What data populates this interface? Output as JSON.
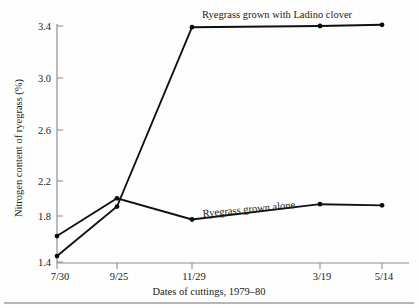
{
  "chart_data": {
    "type": "line",
    "title": "",
    "xlabel": "Dates of cuttings, 1979–80",
    "ylabel": "Nitrogen content of ryegrass (%)",
    "categories": [
      "7/30",
      "9/25",
      "11/29",
      "3/19",
      "5/14"
    ],
    "x_tick_labels": [
      "7/30",
      "9/25",
      "11/29",
      "3/19",
      "5/14"
    ],
    "y_tick_labels": [
      "1.4",
      "1.8",
      "2.2",
      "2.6",
      "3.0",
      "3.4"
    ],
    "y_tick_values": [
      1.4,
      1.8,
      2.2,
      2.6,
      3.0,
      3.4
    ],
    "ylim": [
      1.4,
      3.4
    ],
    "grid": false,
    "legend_position": "inline-annotation",
    "series": [
      {
        "name": "Ryegrass grown with Ladino clover",
        "values": [
          1.45,
          1.87,
          3.39,
          3.4,
          3.41
        ]
      },
      {
        "name": "Ryegrass grown alone",
        "values": [
          1.62,
          1.94,
          1.76,
          1.89,
          1.88
        ]
      }
    ],
    "annotations": [
      {
        "text": "Ryegrass grown with Ladino clover",
        "attached_series": "Ryegrass grown with Ladino clover"
      },
      {
        "text": "Ryegrass grown alone",
        "attached_series": "Ryegrass grown alone"
      }
    ]
  },
  "colors": {
    "line": "#111111",
    "axis": "#8e8e8e",
    "text": "#1a1a1a",
    "background": "#fefefe"
  }
}
